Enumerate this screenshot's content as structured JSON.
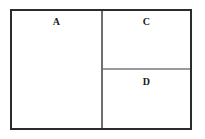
{
  "diagram": {
    "background_color": "#ffffff",
    "frame": {
      "border_color": "#2b2b2b",
      "fill_color": "#ffffff"
    },
    "dividers": {
      "vertical_color": "#6e6e6e",
      "horizontal_color": "#9a9a9a"
    },
    "panels": [
      {
        "label": "A",
        "region": "left-full-height"
      },
      {
        "label": "C",
        "region": "right-top"
      },
      {
        "label": "D",
        "region": "right-bottom"
      }
    ]
  }
}
